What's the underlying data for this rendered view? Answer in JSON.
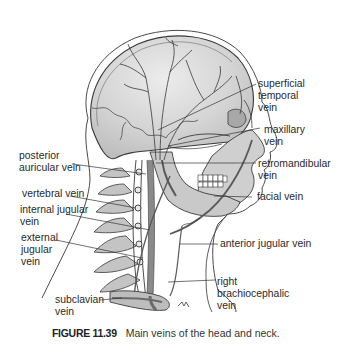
{
  "figure": {
    "number": "FIGURE 11.39",
    "caption": "Main veins of the head and neck."
  },
  "labels": {
    "superficial_temporal_vein": "superficial\ntemporal\nvein",
    "maxillary_vein": "maxillary\nvein",
    "retromandibular_vein": "retromandibular\nvein",
    "facial_vein": "facial vein",
    "anterior_jugular_vein": "anterior jugular vein",
    "right_brachiocephalic_vein": "right\nbrachiocephalic\nvein",
    "posterior_auricular_vein": "posterior\nauricular vein",
    "vertebral_vein": "vertebral vein",
    "internal_jugular_vein": "internal jugular\nvein",
    "external_jugular_vein": "external\njugular\nvein",
    "subclavian_vein": "subclavian\nvein"
  },
  "colors": {
    "skull_fill": "#d2d2d2",
    "skull_light": "#e6e6e6",
    "outline": "#3a3a3a",
    "vein": "#8a8a8a",
    "leader_line": "#333333",
    "text": "#2a2a2a"
  }
}
